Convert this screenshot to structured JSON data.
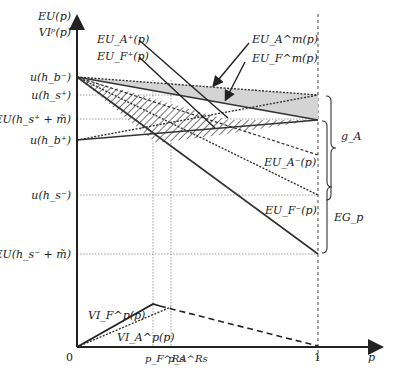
{
  "axes": {
    "y_label_1": "EU(p)",
    "y_label_2": "VIᵖ(p)",
    "x_label": "p",
    "origin_label": "0",
    "x_one_label": "1"
  },
  "y_ticks": [
    {
      "label": "u(h_b⁻)",
      "main": "u",
      "sub": "b",
      "sup": "−",
      "y": 77
    },
    {
      "label": "u(h_s⁺)",
      "main": "u",
      "sub": "s",
      "sup": "+",
      "y": 95
    },
    {
      "label": "EU(h_s⁺ + m̃)",
      "main": "EU",
      "sub": "s",
      "sup": "+",
      "y": 119
    },
    {
      "label": "u(h_b⁺)",
      "main": "u",
      "sub": "b",
      "sup": "+",
      "y": 140
    },
    {
      "label": "u(h_s⁻)",
      "main": "u",
      "sub": "s",
      "sup": "−",
      "y": 195
    },
    {
      "label": "EU(h_s⁻ + m̃)",
      "main": "EU",
      "sub": "s",
      "sup": "−",
      "y": 254
    }
  ],
  "x_ticks": [
    {
      "label": "p_F^Rs",
      "main": "p",
      "sub": "F",
      "sup": "Rs"
    },
    {
      "label": "p_A^Rs",
      "main": "p",
      "sub": "A",
      "sup": "Rs"
    }
  ],
  "curve_labels": {
    "eu_a_plus": "EU_A⁺(p)",
    "eu_f_plus": "EU_F⁺(p)",
    "eu_a_m": "EU_A^m(p)",
    "eu_f_m": "EU_F^m(p)",
    "eu_a_minus": "EU_A⁻(p)",
    "eu_f_minus": "EU_F⁻(p)",
    "vi_f": "VI_F^p(p)",
    "vi_a": "VI_A^p(p)"
  },
  "braces": {
    "g_a": "g_A",
    "eg_p": "EG_p"
  },
  "text": {
    "EU": "EU",
    "u": "u",
    "p": "p",
    "VI": "VI",
    "m": "m̃",
    "plus": "+",
    "minus": "−",
    "lp": "(",
    "rp": ")",
    "F": "F",
    "A": "A",
    "Rs": "Rs",
    "g": "g",
    "EG": "EG",
    "m_sup": "m",
    "p_sup": "p",
    "s": "s",
    "b": "b",
    "h": "h"
  }
}
